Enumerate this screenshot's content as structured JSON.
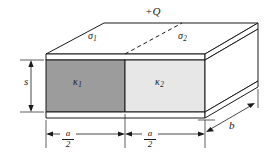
{
  "figure": {
    "kind": "parallel-plate-capacitor-with-two-dielectrics",
    "labels": {
      "charge": "+Q",
      "sigma1_base": "σ",
      "sigma1_sub": "1",
      "sigma2_base": "σ",
      "sigma2_sub": "2",
      "kappa1_base": "κ",
      "kappa1_sub": "1",
      "kappa2_base": "κ",
      "kappa2_sub": "2",
      "thickness": "s",
      "depth": "b",
      "width_numerator": "a",
      "width_denominator": "2"
    },
    "dimensions": {
      "left_vertical": "s",
      "bottom_left_span": "a/2",
      "bottom_right_span": "a/2",
      "right_diagonal": "b"
    },
    "colors": {
      "dielectric_1_fill": "#9c9c9c",
      "dielectric_2_fill": "#e7e7e7",
      "plate_fill": "#ffffff",
      "stroke": "#1a1a1a",
      "background": "#ffffff"
    }
  }
}
